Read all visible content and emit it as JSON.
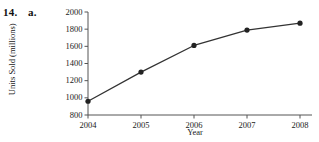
{
  "problem": {
    "number": "14.",
    "part": "a."
  },
  "chart_data": {
    "type": "line",
    "title": "",
    "xlabel": "Year",
    "ylabel": "Units Sold (millions)",
    "x": [
      2004,
      2005,
      2006,
      2007,
      2008
    ],
    "categories": [
      "2004",
      "2005",
      "2006",
      "2007",
      "2008"
    ],
    "values": [
      960,
      1300,
      1610,
      1790,
      1870
    ],
    "series": [
      {
        "name": "Units Sold",
        "values": [
          960,
          1300,
          1610,
          1790,
          1870
        ]
      }
    ],
    "xlim": [
      2004,
      2008
    ],
    "ylim": [
      800,
      2000
    ],
    "ytick_labels": [
      "800",
      "1000",
      "1200",
      "1400",
      "1600",
      "1800",
      "2000"
    ],
    "yticks": [
      800,
      1000,
      1200,
      1400,
      1600,
      1800,
      2000
    ],
    "xtick_labels": [
      "2004",
      "2005",
      "2006",
      "2007",
      "2008"
    ],
    "grid": false,
    "legend": false,
    "legend_position": "none",
    "marker": "filled-circle",
    "line_color": "#333333",
    "marker_color": "#222222",
    "axis_color": "#555555"
  }
}
